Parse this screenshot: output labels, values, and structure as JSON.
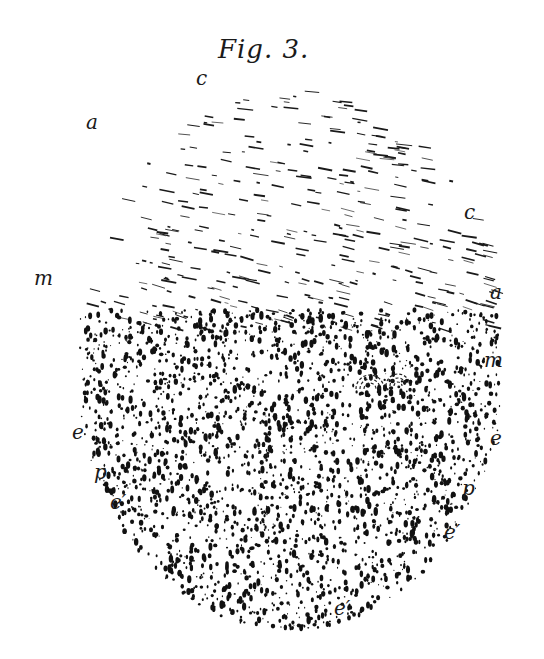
{
  "figure": {
    "title": "Fig. 3.",
    "labels": [
      {
        "id": "c-top",
        "text": "c",
        "x": 196,
        "y": 68
      },
      {
        "id": "a-left",
        "text": "a",
        "x": 86,
        "y": 112
      },
      {
        "id": "c-right",
        "text": "c",
        "x": 464,
        "y": 202
      },
      {
        "id": "m-left",
        "text": "m",
        "x": 34,
        "y": 268
      },
      {
        "id": "a-right",
        "text": "a",
        "x": 490,
        "y": 282
      },
      {
        "id": "m-right",
        "text": "m",
        "x": 484,
        "y": 350
      },
      {
        "id": "e-left",
        "text": "e",
        "x": 72,
        "y": 422
      },
      {
        "id": "e-right",
        "text": "e",
        "x": 490,
        "y": 428
      },
      {
        "id": "p-left",
        "text": "p",
        "x": 94,
        "y": 462
      },
      {
        "id": "p-right",
        "text": "p",
        "x": 462,
        "y": 478
      },
      {
        "id": "e-prime-left",
        "text": "e′",
        "x": 110,
        "y": 492
      },
      {
        "id": "e-prime-right",
        "text": "e′",
        "x": 444,
        "y": 522
      },
      {
        "id": "e-prime-bottom",
        "text": "e′",
        "x": 334,
        "y": 598
      }
    ]
  }
}
